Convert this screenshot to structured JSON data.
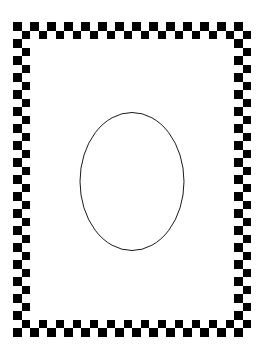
{
  "canvas": {
    "width": 264,
    "height": 362,
    "background_color": "#ffffff",
    "title": "Checkerboard Frame with Ellipse"
  },
  "figure": {
    "ink_color": "#000000",
    "paper_color": "#ffffff"
  },
  "frame": {
    "name": "checkerboard-border",
    "color": "#000000",
    "outer": {
      "x": 13,
      "y": 22,
      "width": 237,
      "height": 314
    },
    "cell_size": 8.5,
    "band_depth_cells": 2,
    "cols": 28,
    "rows": 37,
    "pattern": "alternating-checker",
    "phase": 0
  },
  "ellipse": {
    "name": "center-ellipse",
    "cx": 132,
    "cy": 181.5,
    "rx": 52,
    "ry": 69,
    "stroke_color": "#1a1a1a",
    "stroke_width": 1,
    "fill": "none"
  },
  "interior": {
    "name": "frame-interior",
    "x": 30,
    "y": 39,
    "width": 203,
    "height": 280,
    "color": "#ffffff"
  }
}
